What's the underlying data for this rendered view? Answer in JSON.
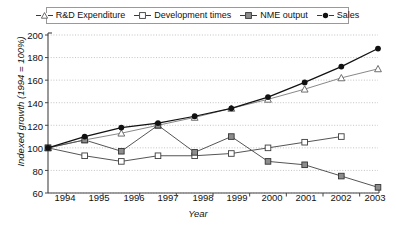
{
  "chart_data": {
    "type": "line",
    "title": "",
    "xlabel": "Year",
    "ylabel": "Indexed growth (1994 = 100%)",
    "categories": [
      "1994",
      "1995",
      "1996",
      "1997",
      "1998",
      "1999",
      "2000",
      "2001",
      "2002",
      "2003"
    ],
    "x": [
      1994,
      1995,
      1996,
      1997,
      1998,
      1999,
      2000,
      2001,
      2002,
      2003
    ],
    "xlim": [
      1994,
      2003
    ],
    "ylim": [
      60,
      200
    ],
    "yticks": [
      60,
      80,
      100,
      120,
      140,
      160,
      180,
      200
    ],
    "grid": true,
    "legend_position": "top",
    "series": [
      {
        "name": "R&D Expenditure",
        "marker": "triangle-open",
        "color": "#888888",
        "values": [
          100,
          107,
          113,
          120,
          127,
          135,
          143,
          152,
          162,
          170
        ]
      },
      {
        "name": "Development times",
        "marker": "square-open",
        "color": "#555555",
        "values": [
          100,
          93,
          88,
          93,
          93,
          95,
          100,
          105,
          110,
          null
        ]
      },
      {
        "name": "NME output",
        "marker": "square-grey",
        "color": "#555555",
        "values": [
          100,
          107,
          97,
          120,
          96,
          110,
          88,
          85,
          75,
          65
        ]
      },
      {
        "name": "Sales",
        "marker": "circle-filled",
        "color": "#111111",
        "values": [
          100,
          110,
          118,
          122,
          128,
          135,
          145,
          158,
          172,
          188
        ]
      }
    ]
  },
  "legend": {
    "items": [
      {
        "label": "R&D Expenditure"
      },
      {
        "label": "Development times"
      },
      {
        "label": "NME output"
      },
      {
        "label": "Sales"
      }
    ]
  },
  "axes": {
    "y_title": "Indexed growth (1994 = 100%)",
    "x_title": "Year",
    "y_tick_labels": [
      "200",
      "180",
      "160",
      "140",
      "120",
      "100",
      "80",
      "60"
    ],
    "x_tick_labels": [
      "1994",
      "1995",
      "1996",
      "1997",
      "1998",
      "1999",
      "2000",
      "2001",
      "2002",
      "2003"
    ]
  }
}
